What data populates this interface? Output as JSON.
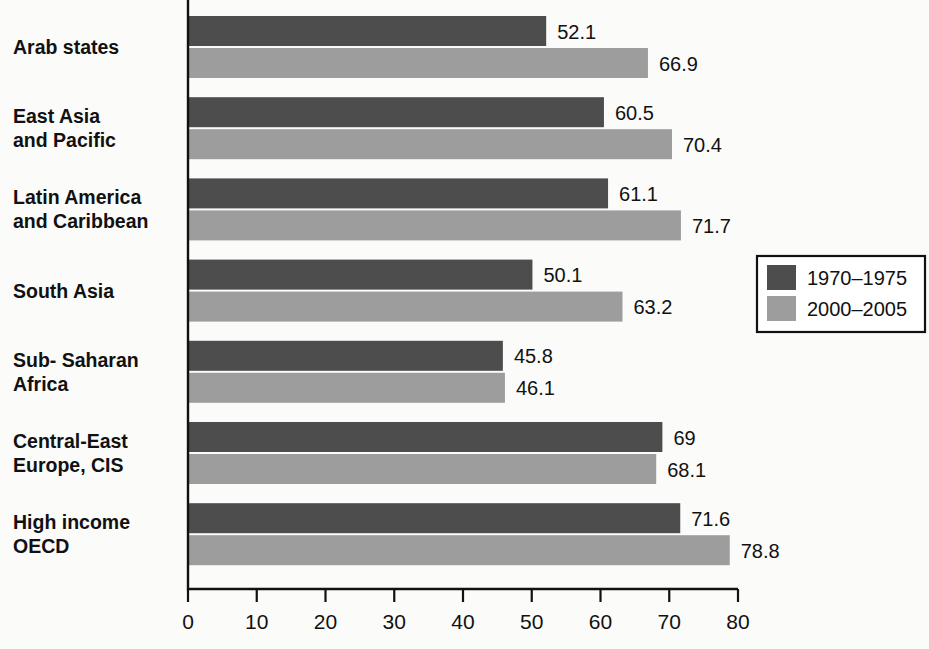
{
  "chart_data": {
    "type": "bar",
    "orientation": "horizontal",
    "title": "",
    "subtitle": "",
    "xlabel": "",
    "ylabel": "",
    "xlim": [
      0,
      80
    ],
    "xticks": [
      0,
      10,
      20,
      30,
      40,
      50,
      60,
      70,
      80
    ],
    "xtick_labels": [
      "0",
      "10",
      "20",
      "30",
      "40",
      "50",
      "60",
      "70",
      "80"
    ],
    "grid": false,
    "legend_position": "right",
    "categories": [
      "Arab states",
      "East Asia and Pacific",
      "Latin America and Caribbean",
      "South Asia",
      "Sub- Saharan Africa",
      "Central-East Europe, CIS",
      "High income OECD"
    ],
    "category_lines": [
      [
        "Arab states"
      ],
      [
        "East Asia",
        "and Pacific"
      ],
      [
        "Latin America",
        "and Caribbean"
      ],
      [
        "South Asia"
      ],
      [
        "Sub- Saharan",
        "Africa"
      ],
      [
        "Central-East",
        "Europe, CIS"
      ],
      [
        "High income",
        "OECD"
      ]
    ],
    "series": [
      {
        "name": "1970–1975",
        "color": "#4d4d4d",
        "values": [
          52.1,
          60.5,
          61.1,
          50.1,
          45.8,
          69,
          71.6
        ],
        "value_labels": [
          "52.1",
          "60.5",
          "61.1",
          "50.1",
          "45.8",
          "69",
          "71.6"
        ]
      },
      {
        "name": "2000–2005",
        "color": "#9d9d9d",
        "values": [
          66.9,
          70.4,
          71.7,
          63.2,
          46.1,
          68.1,
          78.8
        ],
        "value_labels": [
          "66.9",
          "70.4",
          "71.7",
          "63.2",
          "46.1",
          "68.1",
          "78.8"
        ]
      }
    ]
  },
  "legend": {
    "entries": [
      {
        "label": "1970–1975",
        "color": "#4d4d4d"
      },
      {
        "label": "2000–2005",
        "color": "#9d9d9d"
      }
    ]
  },
  "colors": {
    "series_1970_1975": "#4d4d4d",
    "series_2000_2005": "#9d9d9d",
    "axis": "#111111",
    "text": "#111111",
    "background": "#fbfbf9"
  }
}
